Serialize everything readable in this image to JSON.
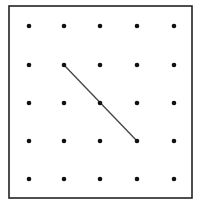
{
  "diagram": {
    "type": "geoboard",
    "frame": {
      "x1": 9,
      "y1": 6,
      "x2": 192,
      "y2": 198,
      "stroke": "#222222"
    },
    "grid": {
      "columns": 5,
      "rows": 5,
      "x": [
        29,
        64,
        100,
        137,
        174
      ],
      "y": [
        26,
        65,
        103,
        141,
        179
      ],
      "dot_radius": 2.3,
      "dot_color": "#111111"
    },
    "segments": [
      {
        "from": [
          1,
          1
        ],
        "to": [
          3,
          3
        ],
        "passes_through": [
          [
            2,
            2
          ]
        ],
        "color": "#444444",
        "width": 1.3
      }
    ]
  }
}
